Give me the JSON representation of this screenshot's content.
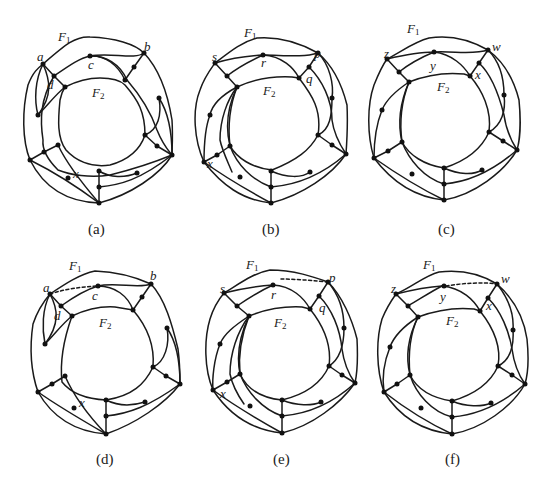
{
  "figure": {
    "panels": [
      {
        "id": "a",
        "caption": "(a)",
        "face_labels": {
          "outer": "F",
          "outer_sub": "1",
          "inner": "F",
          "inner_sub": "2"
        },
        "vertex_labels": [
          {
            "text": "a",
            "x": 37,
            "y": 50
          },
          {
            "text": "b",
            "x": 144,
            "y": 40
          },
          {
            "text": "c",
            "x": 88,
            "y": 58
          },
          {
            "text": "d",
            "x": 47,
            "y": 78
          },
          {
            "text": "x",
            "x": 73,
            "y": 167
          }
        ],
        "dashed_edge": false
      },
      {
        "id": "b",
        "caption": "(b)",
        "face_labels": {
          "outer": "F",
          "outer_sub": "1",
          "inner": "F",
          "inner_sub": "2"
        },
        "vertex_labels": [
          {
            "text": "s",
            "x": 30,
            "y": 50
          },
          {
            "text": "p",
            "x": 132,
            "y": 47
          },
          {
            "text": "r",
            "x": 79,
            "y": 56
          },
          {
            "text": "q",
            "x": 124,
            "y": 72
          },
          {
            "text": "x",
            "x": 25,
            "y": 157
          }
        ],
        "dashed_edge": false
      },
      {
        "id": "c",
        "caption": "(c)",
        "face_labels": {
          "outer": "F",
          "outer_sub": "1",
          "inner": "F",
          "inner_sub": "2"
        },
        "vertex_labels": [
          {
            "text": "z",
            "x": 20,
            "y": 50
          },
          {
            "text": "w",
            "x": 128,
            "y": 43
          },
          {
            "text": "y",
            "x": 66,
            "y": 61
          },
          {
            "text": "x",
            "x": 111,
            "y": 70
          }
        ],
        "dashed_edge": false
      },
      {
        "id": "d",
        "caption": "(d)",
        "face_labels": {
          "outer": "F",
          "outer_sub": "1",
          "inner": "F",
          "inner_sub": "2"
        },
        "vertex_labels": [
          {
            "text": "a",
            "x": 43,
            "y": 37
          },
          {
            "text": "b",
            "x": 150,
            "y": 25
          },
          {
            "text": "c",
            "x": 92,
            "y": 45
          },
          {
            "text": "d",
            "x": 54,
            "y": 65
          },
          {
            "text": "x",
            "x": 79,
            "y": 152
          }
        ],
        "dashed_edge": true
      },
      {
        "id": "e",
        "caption": "(e)",
        "face_labels": {
          "outer": "F",
          "outer_sub": "1",
          "inner": "F",
          "inner_sub": "2"
        },
        "vertex_labels": [
          {
            "text": "s",
            "x": 38,
            "y": 38
          },
          {
            "text": "p",
            "x": 147,
            "y": 27
          },
          {
            "text": "r",
            "x": 89,
            "y": 44
          },
          {
            "text": "q",
            "x": 137,
            "y": 57
          },
          {
            "text": "x",
            "x": 38,
            "y": 143
          }
        ],
        "dashed_edge": true
      },
      {
        "id": "f",
        "caption": "(f)",
        "face_labels": {
          "outer": "F",
          "outer_sub": "1",
          "inner": "F",
          "inner_sub": "2"
        },
        "vertex_labels": [
          {
            "text": "z",
            "x": 27,
            "y": 40
          },
          {
            "text": "w",
            "x": 137,
            "y": 28
          },
          {
            "text": "y",
            "x": 76,
            "y": 48
          },
          {
            "text": "x",
            "x": 122,
            "y": 56
          }
        ],
        "dashed_edge": true
      }
    ]
  }
}
